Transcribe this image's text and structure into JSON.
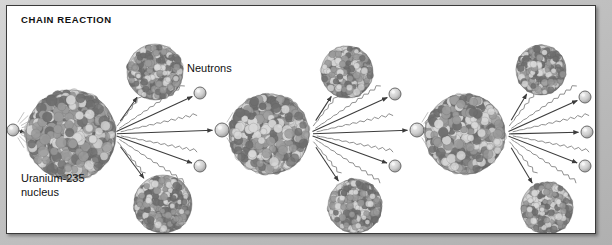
{
  "figure": {
    "title": "CHAIN REACTION",
    "kind": "nuclear-fission-chain-reaction-diagram",
    "background_color": "#c4c4c4",
    "panel_color": "#ffffff",
    "border_color": "#3a3a3a",
    "text_color": "#111111"
  },
  "labels": {
    "title": "CHAIN REACTION",
    "neutrons": "Neutrons",
    "uranium": "Uranium-235\nnucleus"
  },
  "legend_colors": {
    "nucleus_dark": "#6e6e6e",
    "nucleus_mid": "#9a9a9a",
    "nucleus_light": "#d8d8d8",
    "neutron_fill": "#c9c9c9",
    "neutron_stroke": "#6a6a6a",
    "arrow": "#3c3c3c",
    "gamma_wave": "#8f8f8f"
  },
  "chart_data": {
    "type": "diagram",
    "title": "CHAIN REACTION",
    "stages": 3,
    "big_nuclei": [
      {
        "id": "u235-1",
        "cx": 64,
        "cy": 129,
        "r": 45,
        "role": "uranium-235-nucleus",
        "stage": 1
      },
      {
        "id": "u235-2",
        "cx": 262,
        "cy": 128,
        "r": 40,
        "role": "uranium-235-nucleus",
        "stage": 2
      },
      {
        "id": "u235-3",
        "cx": 458,
        "cy": 128,
        "r": 40,
        "role": "uranium-235-nucleus",
        "stage": 3
      }
    ],
    "fragment_nuclei": [
      {
        "id": "frag-1-top",
        "cx": 148,
        "cy": 66,
        "r": 28,
        "stage": 1
      },
      {
        "id": "frag-1-bot",
        "cx": 156,
        "cy": 198,
        "r": 29,
        "stage": 1
      },
      {
        "id": "frag-2-top",
        "cx": 340,
        "cy": 66,
        "r": 26,
        "stage": 2
      },
      {
        "id": "frag-2-bot",
        "cx": 348,
        "cy": 200,
        "r": 27,
        "stage": 2
      },
      {
        "id": "frag-3-top",
        "cx": 534,
        "cy": 64,
        "r": 25,
        "stage": 3
      },
      {
        "id": "frag-3-bot",
        "cx": 540,
        "cy": 202,
        "r": 26,
        "stage": 3
      }
    ],
    "neutrons": [
      {
        "id": "n-incoming",
        "cx": 6,
        "cy": 124,
        "r": 6
      },
      {
        "id": "n-mid-1",
        "cx": 193,
        "cy": 87,
        "r": 6
      },
      {
        "id": "n-strike-2",
        "cx": 215,
        "cy": 124,
        "r": 7
      },
      {
        "id": "n-mid-2",
        "cx": 193,
        "cy": 160,
        "r": 6
      },
      {
        "id": "n-mid-3",
        "cx": 388,
        "cy": 88,
        "r": 6
      },
      {
        "id": "n-strike-3",
        "cx": 410,
        "cy": 124,
        "r": 7
      },
      {
        "id": "n-mid-4",
        "cx": 388,
        "cy": 160,
        "r": 6
      },
      {
        "id": "n-out-1",
        "cx": 578,
        "cy": 91,
        "r": 6
      },
      {
        "id": "n-out-2",
        "cx": 580,
        "cy": 126,
        "r": 6
      },
      {
        "id": "n-out-3",
        "cx": 578,
        "cy": 160,
        "r": 6
      }
    ],
    "emission_groups": [
      {
        "stage": 1,
        "origin_x": 104,
        "origin_y": 128,
        "neutron_arrows": 3,
        "gamma_waves": 4,
        "fragment_arrows": 2
      },
      {
        "stage": 2,
        "origin_x": 300,
        "origin_y": 128,
        "neutron_arrows": 3,
        "gamma_waves": 4,
        "fragment_arrows": 2
      },
      {
        "stage": 3,
        "origin_x": 496,
        "origin_y": 128,
        "neutron_arrows": 3,
        "gamma_waves": 4,
        "fragment_arrows": 2
      }
    ]
  }
}
